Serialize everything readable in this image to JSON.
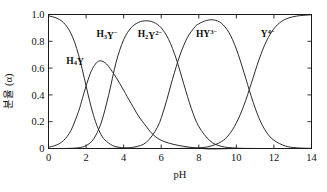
{
  "chart_data": {
    "type": "line",
    "title": "",
    "xlabel": "pH",
    "ylabel": "분율 (α)",
    "xlim": [
      0,
      14
    ],
    "ylim": [
      0,
      1.0
    ],
    "grid": false,
    "legend_position": "inline-annotations",
    "x_ticks": [
      "0",
      "2",
      "4",
      "6",
      "8",
      "10",
      "12",
      "14"
    ],
    "x_tick_values": [
      0,
      2,
      4,
      6,
      8,
      10,
      12,
      14
    ],
    "y_ticks": [
      "0",
      "0.2",
      "0.4",
      "0.6",
      "0.8",
      "1.0"
    ],
    "y_tick_values": [
      0,
      0.2,
      0.4,
      0.6,
      0.8,
      1.0
    ],
    "pka_values": [
      1.99,
      2.67,
      6.16,
      10.26
    ],
    "series": [
      {
        "name": "H4Y",
        "label_html": "H<sub>4</sub>Y",
        "label_x": 0.95,
        "label_y": 0.66,
        "x": [
          0.0,
          0.2,
          0.4,
          0.6,
          0.8,
          1.0,
          1.2,
          1.4,
          1.6,
          1.8,
          2.0,
          2.2,
          2.4,
          2.6,
          2.8,
          3.0,
          3.4,
          3.8,
          4.2,
          5.0,
          6.0,
          8.0,
          10.0,
          12.0,
          14.0
        ],
        "y": [
          0.99,
          0.984,
          0.975,
          0.961,
          0.939,
          0.906,
          0.857,
          0.789,
          0.699,
          0.589,
          0.468,
          0.349,
          0.245,
          0.163,
          0.104,
          0.064,
          0.023,
          0.008,
          0.0027,
          0.0003,
          0.0,
          0.0,
          0.0,
          0.0,
          0.0
        ]
      },
      {
        "name": "H3Y-",
        "label_html": "H<sub>3</sub>Y<sup>−</sup>",
        "label_x": 2.55,
        "label_y": 0.86,
        "x": [
          0.0,
          0.4,
          0.8,
          1.2,
          1.6,
          1.8,
          2.0,
          2.2,
          2.3,
          2.4,
          2.6,
          2.8,
          3.0,
          3.2,
          3.6,
          4.0,
          4.4,
          5.0,
          6.0,
          8.0,
          10.0,
          12.0,
          14.0
        ],
        "y": [
          0.0099,
          0.0246,
          0.0592,
          0.1356,
          0.2774,
          0.3709,
          0.466,
          0.5508,
          0.5841,
          0.6109,
          0.6462,
          0.654,
          0.6406,
          0.6122,
          0.5303,
          0.4346,
          0.3356,
          0.2019,
          0.0611,
          0.0014,
          0.0,
          0.0,
          0.0
        ]
      },
      {
        "name": "H2Y2-",
        "label_html": "H<sub>2</sub>Y<sup>2−</sup>",
        "label_x": 4.75,
        "label_y": 0.86,
        "x": [
          0.0,
          1.0,
          1.6,
          2.0,
          2.4,
          2.8,
          3.2,
          3.6,
          4.0,
          4.4,
          4.8,
          5.2,
          5.6,
          6.0,
          6.4,
          6.8,
          7.2,
          7.6,
          8.0,
          8.6,
          9.2,
          10.0,
          11.0,
          12.0,
          14.0
        ],
        "y": [
          0.0,
          0.0005,
          0.0057,
          0.0214,
          0.0705,
          0.1896,
          0.3974,
          0.6441,
          0.8114,
          0.9014,
          0.9418,
          0.9529,
          0.9418,
          0.9002,
          0.8128,
          0.6689,
          0.482,
          0.2995,
          0.1643,
          0.057,
          0.0162,
          0.0029,
          0.0003,
          0.0,
          0.0
        ]
      },
      {
        "name": "HY3-",
        "label_html": "HY<sup>3−</sup>",
        "label_x": 7.85,
        "label_y": 0.86,
        "x": [
          0.0,
          2.0,
          3.0,
          4.0,
          4.6,
          5.2,
          5.8,
          6.2,
          6.6,
          7.0,
          7.4,
          7.8,
          8.0,
          8.4,
          8.8,
          9.2,
          9.6,
          10.0,
          10.4,
          10.8,
          11.2,
          11.6,
          12.0,
          12.6,
          13.2,
          14.0
        ],
        "y": [
          0.0,
          0.0,
          0.0001,
          0.0027,
          0.0118,
          0.0455,
          0.1589,
          0.316,
          0.5165,
          0.6979,
          0.8297,
          0.908,
          0.9304,
          0.9552,
          0.9594,
          0.9349,
          0.8669,
          0.742,
          0.5697,
          0.3852,
          0.2285,
          0.1219,
          0.0615,
          0.0186,
          0.0053,
          0.001
        ]
      },
      {
        "name": "Y4-",
        "label_html": "Y<sup>4−</sup>",
        "label_x": 11.3,
        "label_y": 0.86,
        "x": [
          0.0,
          4.0,
          6.0,
          7.0,
          8.0,
          8.6,
          9.2,
          9.6,
          10.0,
          10.4,
          10.8,
          11.2,
          11.6,
          12.0,
          12.4,
          12.8,
          13.2,
          13.6,
          14.0
        ],
        "y": [
          0.0,
          0.0,
          0.0,
          0.0004,
          0.0051,
          0.0165,
          0.0505,
          0.102,
          0.1908,
          0.3208,
          0.4876,
          0.6608,
          0.8009,
          0.8945,
          0.9478,
          0.9747,
          0.988,
          0.9944,
          0.9975
        ]
      }
    ]
  },
  "axes": {
    "x_title": "pH",
    "y_title": "분율 (α)"
  },
  "colors": {
    "background": "#ffffff",
    "axis": "#1a1a1a",
    "curve": "#2a2a2a",
    "text": "#111111"
  }
}
